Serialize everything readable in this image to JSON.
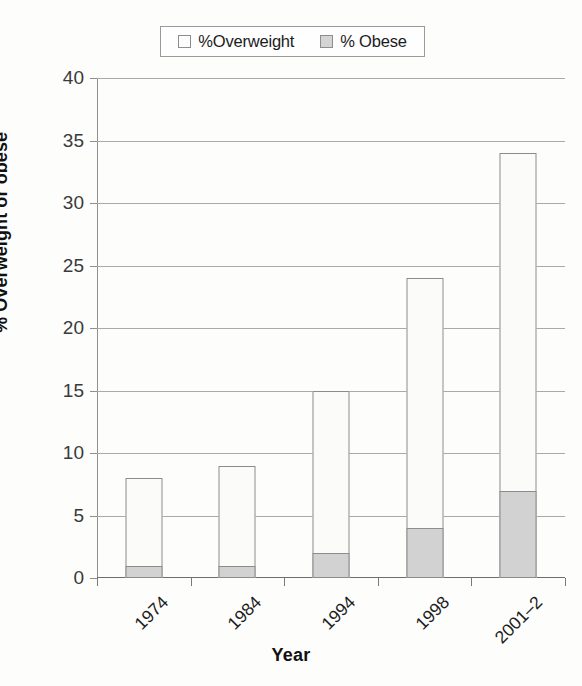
{
  "chart_data": {
    "type": "bar",
    "subtype": "stacked",
    "title": "",
    "xlabel": "Year",
    "ylabel": "% Overweight or obese",
    "categories": [
      "1974",
      "1984",
      "1994",
      "1998",
      "2001–2"
    ],
    "series": [
      {
        "name": "%Overweight",
        "values": [
          8,
          9,
          15,
          24,
          34
        ],
        "note": "total bar height (overweight incl. obese)",
        "color": "#fbfbfa"
      },
      {
        "name": "% Obese",
        "values": [
          1,
          1,
          2,
          4,
          7
        ],
        "color": "#d2d2d2"
      }
    ],
    "ylim": [
      0,
      40
    ],
    "yticks": [
      0,
      5,
      10,
      15,
      20,
      25,
      30,
      35,
      40
    ],
    "ytick_labels": [
      "0",
      "5",
      "10",
      "15",
      "20",
      "25",
      "30",
      "35",
      "40"
    ],
    "grid": "horizontal",
    "legend_position": "top-center"
  },
  "legend": {
    "entries": [
      {
        "label": "%Overweight",
        "swatch": "legend-swatch-overweight"
      },
      {
        "label": "% Obese",
        "swatch": "legend-swatch-obese"
      }
    ]
  },
  "axes": {
    "y_title": "% Overweight or obese",
    "x_title": "Year"
  },
  "colors": {
    "overweight_fill": "#fbfbfa",
    "obese_fill": "#d2d2d2",
    "bar_border": "#8c8c8c",
    "gridline": "#a9a9a9",
    "background": "#fdfdfc"
  }
}
